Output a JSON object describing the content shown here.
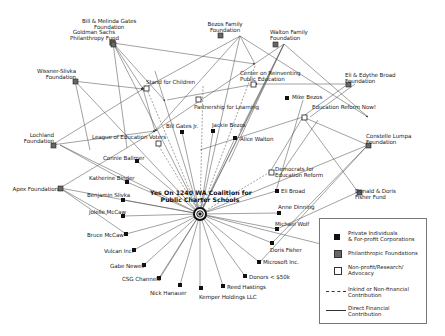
{
  "diagram": {
    "hub": {
      "label_line1": "Yes On 1240 WA Coalition for",
      "label_line2": "Public Charter Schools"
    },
    "nodes": {
      "gates_foundation": {
        "line1": "Bill & Melinda Gates",
        "line2": "Foundation",
        "type": "foundation"
      },
      "goldman": {
        "line1": "Goldman Sachs",
        "line2": "Philanthropy Fund",
        "type": "foundation"
      },
      "bezos_family": {
        "line1": "Bezos Family",
        "line2": "Foundation",
        "type": "foundation"
      },
      "walton_family": {
        "line1": "Walton Family",
        "line2": "Foundation",
        "type": "foundation"
      },
      "wissner": {
        "line1": "Wissner-Slivka",
        "line2": "Foundation",
        "type": "foundation"
      },
      "broad_foundation": {
        "line1": "Eli & Edythe Broad",
        "line2": "Foundation",
        "type": "foundation"
      },
      "lochland": {
        "line1": "Lochland",
        "line2": "Foundation",
        "type": "foundation"
      },
      "apex": {
        "line1": "Apex Foundation",
        "type": "foundation"
      },
      "lumpa": {
        "line1": "Constelle Lumpa",
        "line2": "Foundation",
        "type": "foundation"
      },
      "fisher_fund": {
        "line1": "Donald & Doris",
        "line2": "Fisher Fund",
        "type": "foundation"
      },
      "stand": {
        "line1": "Stand for Children",
        "type": "nonprofit"
      },
      "crpe": {
        "line1": "Center on Reinventing",
        "line2": "Public Education",
        "type": "nonprofit"
      },
      "partnership": {
        "line1": "Partnership for Learning",
        "type": "nonprofit"
      },
      "league": {
        "line1": "League of Education Voters",
        "type": "nonprofit"
      },
      "ern": {
        "line1": "Education Reform Now!",
        "type": "nonprofit"
      },
      "dfer": {
        "line1": "Democrats for",
        "line2": "Education Reform",
        "type": "nonprofit"
      },
      "mike_bezos": {
        "line1": "Mike Bezos",
        "type": "private"
      },
      "bill_gates_jr": {
        "line1": "Bill Gates Jr.",
        "type": "private"
      },
      "jackie_bezos": {
        "line1": "Jackie Bezos",
        "type": "private"
      },
      "alice_walton": {
        "line1": "Alice Walton",
        "type": "private"
      },
      "connie": {
        "line1": "Connie Ballmer",
        "type": "private"
      },
      "katherine": {
        "line1": "Katherine Binder",
        "type": "private"
      },
      "benjamin": {
        "line1": "Benjamin Slivka",
        "type": "private"
      },
      "jolelle": {
        "line1": "Jolelle McCaw",
        "type": "private"
      },
      "bruce": {
        "line1": "Bruce McCaw",
        "type": "private"
      },
      "vulcan": {
        "line1": "Vulcan Inc.",
        "type": "private"
      },
      "gabe": {
        "line1": "Gabe Newell",
        "type": "private"
      },
      "csg": {
        "line1": "CSG Channels",
        "type": "private"
      },
      "nick": {
        "line1": "Nick Hanauer",
        "type": "private"
      },
      "kemper": {
        "line1": "Kemper Holdings LLC",
        "type": "private"
      },
      "reed": {
        "line1": "Reed Hastings",
        "type": "private"
      },
      "donors": {
        "line1": "Donors < $50k",
        "type": "private"
      },
      "microsoft": {
        "line1": "Microsoft Inc.",
        "type": "private"
      },
      "doris": {
        "line1": "Doris Fisher",
        "type": "private"
      },
      "michael": {
        "line1": "Michael Wolf",
        "type": "private"
      },
      "anne": {
        "line1": "Anne Dinning",
        "type": "private"
      },
      "eli": {
        "line1": "Eli Broad",
        "type": "private"
      }
    }
  },
  "legend": {
    "private": "Private Individuals",
    "private2": "& For-profit Corporations",
    "foundation": "Philanthropic Foundations",
    "nonprofit": "Non-profit/Research/",
    "nonprofit2": "Advocacy",
    "inkind": "Inkind or Non-financial",
    "inkind2": "Contribution",
    "direct": "Direct Financial",
    "direct2": "Contribution"
  },
  "colors": {
    "private": "#111111",
    "foundation": "#666666",
    "nonprofit": "#ffffff",
    "edge": "#555555"
  }
}
